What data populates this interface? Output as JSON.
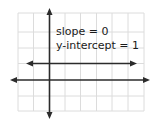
{
  "diagram": {
    "type": "coordinate-plane-line-graph",
    "annotation": {
      "slope_label": "slope = 0",
      "intercept_label": "y-intercept = 1"
    },
    "grid": {
      "columns": 8,
      "rows": 6,
      "color": "#d9d9d9"
    },
    "axes": {
      "color": "#2b2b2b"
    },
    "line": {
      "equation": "y = 1",
      "slope": 0,
      "y_intercept": 1,
      "color": "#2b2b2b"
    }
  }
}
